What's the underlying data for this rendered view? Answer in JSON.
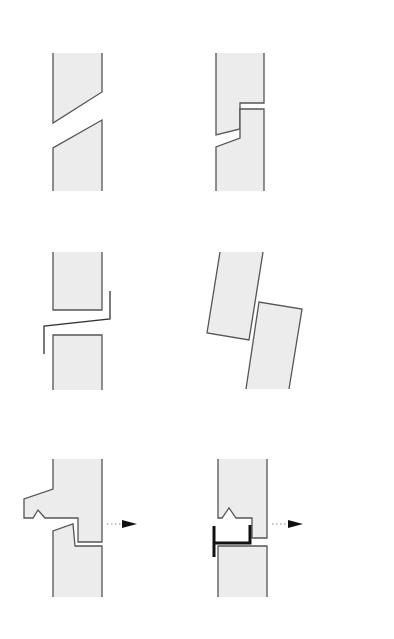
{
  "figure": {
    "description": "Six cross-section details of vertical panel joints",
    "colors": {
      "panel_fill": "#ececec",
      "outline": "#555555",
      "connector": "#111111",
      "background": "#ffffff"
    },
    "details": [
      {
        "id": "bevelled-joint",
        "label": "Sloped (bevelled) butt joint"
      },
      {
        "id": "stepped-joint",
        "label": "Stepped rebated joint"
      },
      {
        "id": "flashed-joint",
        "label": "Open joint with Z-flashing"
      },
      {
        "id": "tilted-panels",
        "label": "Displaced / tilted panels"
      },
      {
        "id": "hooked-joint",
        "label": "Hooked overlap joint with movement arrow"
      },
      {
        "id": "bracketed-joint",
        "label": "Joint with metal bracket and movement arrow"
      }
    ],
    "icons": [
      "arrow-right-icon",
      "arrow-right-icon"
    ]
  }
}
